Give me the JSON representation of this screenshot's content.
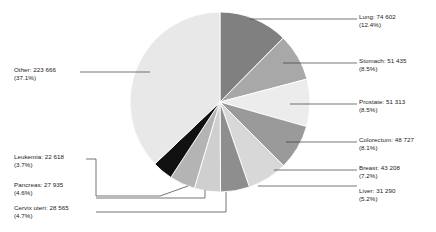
{
  "chart_data": {
    "type": "pie",
    "title": "",
    "subtitle": "",
    "xlabel": "",
    "ylabel": "",
    "legend_position": "callout-labels",
    "grid": false,
    "total": 602349,
    "units": "cases",
    "start_angle_deg": 0,
    "direction": "clockwise",
    "categories": [
      "Lung",
      "Stomach",
      "Prostate",
      "Colorectum",
      "Breast",
      "Liver",
      "Cervix uteri",
      "Pancreas",
      "Leukemia",
      "Other"
    ],
    "values": [
      74602,
      51435,
      51313,
      48727,
      43208,
      31290,
      28565,
      27935,
      22618,
      223666
    ],
    "percentages": [
      12.4,
      8.5,
      8.5,
      8.1,
      7.2,
      5.2,
      4.7,
      4.6,
      3.7,
      37.1
    ],
    "colors": [
      "#808080",
      "#a8a8a8",
      "#ececec",
      "#9a9a9a",
      "#d8d8d8",
      "#8e8e8e",
      "#cfcfcf",
      "#b4b4b4",
      "#111111",
      "#e8e8e8"
    ],
    "slices": [
      {
        "label": "Lung",
        "value": 74602,
        "percent": 12.4,
        "color": "#808080",
        "side": "right"
      },
      {
        "label": "Stomach",
        "value": 51435,
        "percent": 8.5,
        "color": "#a8a8a8",
        "side": "right"
      },
      {
        "label": "Prostate",
        "value": 51313,
        "percent": 8.5,
        "color": "#ececec",
        "side": "right"
      },
      {
        "label": "Colorectum",
        "value": 48727,
        "percent": 8.1,
        "color": "#9a9a9a",
        "side": "right"
      },
      {
        "label": "Breast",
        "value": 43208,
        "percent": 7.2,
        "color": "#d8d8d8",
        "side": "right"
      },
      {
        "label": "Liver",
        "value": 31290,
        "percent": 5.2,
        "color": "#8e8e8e",
        "side": "right"
      },
      {
        "label": "Cervix uteri",
        "value": 28565,
        "percent": 4.7,
        "color": "#cfcfcf",
        "side": "left"
      },
      {
        "label": "Pancreas",
        "value": 27935,
        "percent": 4.6,
        "color": "#b4b4b4",
        "side": "left"
      },
      {
        "label": "Leukemia",
        "value": 22618,
        "percent": 3.7,
        "color": "#111111",
        "side": "left"
      },
      {
        "label": "Other",
        "value": 223666,
        "percent": 37.1,
        "color": "#e8e8e8",
        "side": "left"
      }
    ]
  },
  "labels": {
    "lung": {
      "name": "Lung: 74 602",
      "pct": "(12.4%)"
    },
    "stomach": {
      "name": "Stomach: 51 435",
      "pct": "(8.5%)"
    },
    "prostate": {
      "name": "Prostate: 51 313",
      "pct": "(8.5%)"
    },
    "colorectum": {
      "name": "Colorectum: 48 727",
      "pct": "(8.1%)"
    },
    "breast": {
      "name": "Breast: 43 208",
      "pct": "(7.2%)"
    },
    "liver": {
      "name": "Liver: 31 290",
      "pct": "(5.2%)"
    },
    "cervix": {
      "name": "Cervix uteri: 28 565",
      "pct": "(4.7%)"
    },
    "pancreas": {
      "name": "Pancreas: 27 935",
      "pct": "(4.6%)"
    },
    "leukemia": {
      "name": "Leukemia: 22 618",
      "pct": "(3.7%)"
    },
    "other": {
      "name": "Other: 223 666",
      "pct": "(37.1%)"
    }
  }
}
